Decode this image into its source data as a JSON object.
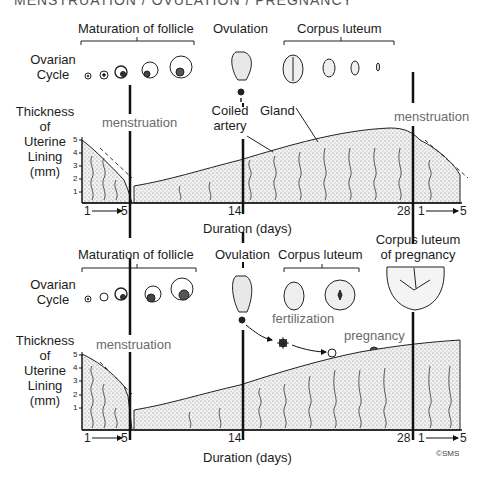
{
  "title": "MENSTRUATION / OVULATION / PREGNANCY",
  "panels": [
    {
      "id": "cycle",
      "ovarian_label_line1": "Ovarian",
      "ovarian_label_line2": "Cycle",
      "stage_labels": {
        "follicle": "Maturation of follicle",
        "ovulation": "Ovulation",
        "corpus_luteum": "Corpus luteum"
      },
      "menstruation_left": "menstruation",
      "menstruation_right": "menstruation",
      "annotations": {
        "coiled_line1": "Coiled",
        "coiled_line2": "artery",
        "gland": "Gland"
      },
      "y_axis": {
        "line1": "Thickness",
        "line2": "of",
        "line3": "Uterine",
        "line4": "Lining",
        "line5": "(mm)",
        "ticks": [
          "5",
          "4",
          "3",
          "2",
          "1"
        ]
      },
      "x_axis": {
        "start": "1",
        "menses_end": "5",
        "day14": "14",
        "day28": "28",
        "next_start": "1",
        "next_end": "5",
        "label": "Duration (days)"
      }
    },
    {
      "id": "pregnancy",
      "ovarian_label_line1": "Ovarian",
      "ovarian_label_line2": "Cycle",
      "stage_labels": {
        "follicle": "Maturation of follicle",
        "ovulation": "Ovulation",
        "corpus_luteum": "Corpus luteum",
        "cl_pregnancy_line1": "Corpus luteum",
        "cl_pregnancy_line2": "of pregnancy"
      },
      "menstruation_left": "menstruation",
      "annotations": {
        "fertilization": "fertilization",
        "pregnancy": "pregnancy"
      },
      "y_axis": {
        "line1": "Thickness",
        "line2": "of",
        "line3": "Uterine",
        "line4": "Lining",
        "line5": "(mm)",
        "ticks": [
          "5",
          "4",
          "3",
          "2",
          "1"
        ]
      },
      "x_axis": {
        "start": "1",
        "menses_end": "5",
        "day14": "14",
        "day28": "28",
        "next_start": "1",
        "next_end": "5",
        "label": "Duration (days)"
      },
      "copyright": "©SMS"
    }
  ],
  "colors": {
    "ink": "#1a1a1a",
    "gray_text": "#6a6a6a",
    "stipple": "#d9d9d9",
    "background": "#ffffff"
  }
}
